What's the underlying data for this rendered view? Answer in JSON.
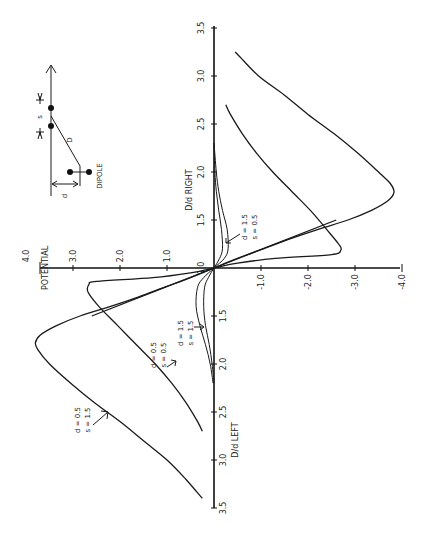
{
  "chart_data": {
    "type": "line",
    "orientation": "rotated 90deg counter-clockwise (D/d runs vertically, POTENTIAL runs horizontally)",
    "title": "",
    "xlabel": "D/d",
    "xlabel_right": "D/d   RIGHT",
    "xlabel_left": "D/d   LEFT",
    "ylabel": "POTENTIAL",
    "x_ticks_right": [
      "1.0",
      "1.5",
      "2.0",
      "2.5",
      "3.0",
      "3.5"
    ],
    "x_ticks_left": [
      "1.5",
      "2.0",
      "2.5",
      "3.0",
      "3.5"
    ],
    "y_ticks": [
      "4.0",
      "3.0",
      "2.0",
      "1.0",
      "-1.0",
      "-2.0",
      "-3.0",
      "-4.0"
    ],
    "xlim": [
      1.0,
      3.5
    ],
    "ylim": [
      -4.0,
      4.0
    ],
    "grid": false,
    "series": [
      {
        "name": "d = 0.5, s = 1.5",
        "note": "signed D/d: positive = RIGHT, negative = LEFT",
        "points": [
          [
            -3.4,
            0.25
          ],
          [
            -3.2,
            0.6
          ],
          [
            -3.0,
            1.0
          ],
          [
            -2.8,
            1.5
          ],
          [
            -2.6,
            2.0
          ],
          [
            -2.4,
            2.55
          ],
          [
            -2.2,
            3.05
          ],
          [
            -2.0,
            3.5
          ],
          [
            -1.85,
            3.75
          ],
          [
            -1.78,
            3.8
          ],
          [
            -1.7,
            3.7
          ],
          [
            -1.6,
            3.35
          ],
          [
            -1.5,
            2.85
          ],
          [
            -1.4,
            2.2
          ],
          [
            -1.3,
            1.6
          ],
          [
            -1.2,
            1.05
          ],
          [
            -1.1,
            0.5
          ],
          [
            -1.0,
            0.0
          ],
          [
            1.1,
            -0.5
          ],
          [
            1.2,
            -1.05
          ],
          [
            1.3,
            -1.6
          ],
          [
            1.4,
            -2.2
          ],
          [
            1.5,
            -2.85
          ],
          [
            1.6,
            -3.35
          ],
          [
            1.7,
            -3.7
          ],
          [
            1.79,
            -3.83
          ],
          [
            1.88,
            -3.75
          ],
          [
            2.0,
            -3.5
          ],
          [
            2.2,
            -3.05
          ],
          [
            2.4,
            -2.55
          ],
          [
            2.6,
            -2.0
          ],
          [
            2.8,
            -1.5
          ],
          [
            3.0,
            -0.95
          ],
          [
            3.2,
            -0.55
          ],
          [
            3.25,
            -0.45
          ]
        ]
      },
      {
        "name": "d = 0.5, s = 0.5",
        "points": [
          [
            -2.7,
            0.25
          ],
          [
            -2.6,
            0.35
          ],
          [
            -2.4,
            0.6
          ],
          [
            -2.2,
            0.9
          ],
          [
            -2.0,
            1.25
          ],
          [
            -1.8,
            1.65
          ],
          [
            -1.6,
            2.05
          ],
          [
            -1.4,
            2.45
          ],
          [
            -1.25,
            2.68
          ],
          [
            -1.17,
            2.66
          ],
          [
            -1.14,
            2.5
          ],
          [
            -1.1,
            1.3
          ],
          [
            -1.05,
            0.5
          ],
          [
            -1.0,
            0.0
          ],
          [
            1.05,
            -0.5
          ],
          [
            1.1,
            -1.3
          ],
          [
            1.14,
            -2.5
          ],
          [
            1.19,
            -2.7
          ],
          [
            1.25,
            -2.65
          ],
          [
            1.4,
            -2.4
          ],
          [
            1.6,
            -2.05
          ],
          [
            1.8,
            -1.65
          ],
          [
            2.0,
            -1.25
          ],
          [
            2.2,
            -0.9
          ],
          [
            2.4,
            -0.6
          ],
          [
            2.6,
            -0.35
          ],
          [
            2.7,
            -0.25
          ]
        ]
      },
      {
        "name": "d = 1.5, s = 1.5",
        "points": [
          [
            -2.2,
            0.02
          ],
          [
            -2.0,
            0.08
          ],
          [
            -1.8,
            0.18
          ],
          [
            -1.6,
            0.3
          ],
          [
            -1.4,
            0.38
          ],
          [
            -1.2,
            0.35
          ],
          [
            -1.1,
            0.22
          ],
          [
            -1.0,
            0.0
          ],
          [
            1.1,
            -0.22
          ],
          [
            1.2,
            -0.3
          ],
          [
            1.4,
            -0.28
          ],
          [
            1.6,
            -0.18
          ],
          [
            1.8,
            -0.1
          ],
          [
            2.0,
            -0.05
          ],
          [
            2.3,
            0.0
          ]
        ]
      },
      {
        "name": "d = 1.5, s = 0.5",
        "points": [
          [
            -2.2,
            0.0
          ],
          [
            -2.0,
            0.04
          ],
          [
            -1.8,
            0.1
          ],
          [
            -1.6,
            0.18
          ],
          [
            -1.4,
            0.22
          ],
          [
            -1.2,
            0.2
          ],
          [
            -1.1,
            0.12
          ],
          [
            -1.0,
            0.0
          ],
          [
            1.1,
            -0.12
          ],
          [
            1.2,
            -0.18
          ],
          [
            1.4,
            -0.16
          ],
          [
            1.6,
            -0.1
          ],
          [
            1.8,
            -0.05
          ],
          [
            2.0,
            -0.02
          ],
          [
            2.3,
            0.0
          ]
        ]
      },
      {
        "name": "line through origin (sharp cross)",
        "points": [
          [
            -1.5,
            2.6
          ],
          [
            1.0,
            0.0
          ],
          [
            1.5,
            -2.6
          ]
        ]
      }
    ],
    "annotations": [
      {
        "text": "d = 0.5\ns = 1.5",
        "target": "d = 0.5, s = 1.5",
        "side": "LEFT"
      },
      {
        "text": "d = 0.5\ns = 0.5",
        "target": "d = 0.5, s = 0.5",
        "side": "LEFT"
      },
      {
        "text": "d = 1.5\ns = 1.5",
        "target": "d = 1.5, s = 1.5",
        "side": "LEFT"
      },
      {
        "text": "d = 1.5\ns = 0.5",
        "target": "d = 1.5, s = 0.5",
        "side": "RIGHT"
      }
    ],
    "inset": {
      "title": "DIPOLE",
      "labels": [
        "s",
        "D",
        "d",
        "DIPOLE"
      ]
    }
  },
  "labels": {
    "potential": "POTENTIAL",
    "right_axis": "D/d    RIGHT",
    "left_axis": "D/d    LEFT",
    "ann1_d": "d = 0.5",
    "ann1_s": "s = 1.5",
    "ann2_d": "d = 0.5",
    "ann2_s": "s = 0.5",
    "ann3_d": "d = 1.5",
    "ann3_s": "s = 1.5",
    "ann4_d": "d = 1.5",
    "ann4_s": "s = 0.5",
    "inset_s": "s",
    "inset_D": "D",
    "inset_d": "d",
    "inset_dipole": "DIPOLE"
  }
}
